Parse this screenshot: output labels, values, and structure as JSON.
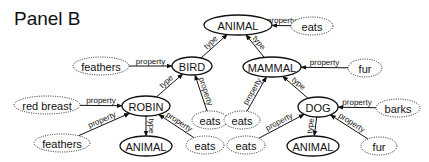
{
  "title": "Panel B",
  "colors": {
    "ink": "#111111",
    "background": "#ffffff"
  },
  "nodes": [
    {
      "id": "animal_top",
      "label": "ANIMAL",
      "kind": "concept",
      "x": 238,
      "y": 25,
      "rx": 34,
      "ry": 10
    },
    {
      "id": "eats_animal",
      "label": "eats",
      "kind": "property",
      "x": 312,
      "y": 26,
      "rx": 21,
      "ry": 9
    },
    {
      "id": "bird",
      "label": "BIRD",
      "kind": "concept",
      "x": 192,
      "y": 66,
      "rx": 20,
      "ry": 9
    },
    {
      "id": "feathers_bird",
      "label": "feathers",
      "kind": "property",
      "x": 101,
      "y": 66,
      "rx": 28,
      "ry": 9
    },
    {
      "id": "mammal",
      "label": "MAMMAL",
      "kind": "concept",
      "x": 272,
      "y": 67,
      "rx": 29,
      "ry": 10
    },
    {
      "id": "fur_mammal",
      "label": "fur",
      "kind": "property",
      "x": 365,
      "y": 68,
      "rx": 17,
      "ry": 9
    },
    {
      "id": "robin",
      "label": "ROBIN",
      "kind": "concept",
      "x": 146,
      "y": 106,
      "rx": 24,
      "ry": 10
    },
    {
      "id": "red_breast",
      "label": "red breast",
      "kind": "property",
      "x": 47,
      "y": 105,
      "rx": 33,
      "ry": 9
    },
    {
      "id": "eats_bird",
      "label": "eats",
      "kind": "property",
      "x": 210,
      "y": 120,
      "rx": 18,
      "ry": 9
    },
    {
      "id": "eats_mammal",
      "label": "eats",
      "kind": "property",
      "x": 242,
      "y": 120,
      "rx": 18,
      "ry": 9
    },
    {
      "id": "dog",
      "label": "DOG",
      "kind": "concept",
      "x": 318,
      "y": 107,
      "rx": 20,
      "ry": 10
    },
    {
      "id": "barks",
      "label": "barks",
      "kind": "property",
      "x": 398,
      "y": 108,
      "rx": 22,
      "ry": 9
    },
    {
      "id": "feathers_robin",
      "label": "feathers",
      "kind": "property",
      "x": 62,
      "y": 143,
      "rx": 28,
      "ry": 9
    },
    {
      "id": "animal_robin",
      "label": "ANIMAL",
      "kind": "concept",
      "x": 146,
      "y": 146,
      "rx": 26,
      "ry": 10
    },
    {
      "id": "eats_robin",
      "label": "eats",
      "kind": "property",
      "x": 205,
      "y": 145,
      "rx": 19,
      "ry": 9
    },
    {
      "id": "eats_dog",
      "label": "eats",
      "kind": "property",
      "x": 246,
      "y": 145,
      "rx": 19,
      "ry": 9
    },
    {
      "id": "animal_dog",
      "label": "ANIMAL",
      "kind": "concept",
      "x": 313,
      "y": 146,
      "rx": 26,
      "ry": 10
    },
    {
      "id": "fur_dog",
      "label": "fur",
      "kind": "property",
      "x": 379,
      "y": 146,
      "rx": 18,
      "ry": 9
    }
  ],
  "edges": [
    {
      "from": "eats_animal",
      "to": "animal_top",
      "label": "property"
    },
    {
      "from": "bird",
      "to": "animal_top",
      "label": "type"
    },
    {
      "from": "mammal",
      "to": "animal_top",
      "label": "type"
    },
    {
      "from": "feathers_bird",
      "to": "bird",
      "label": "property"
    },
    {
      "from": "eats_bird",
      "to": "bird",
      "label": "property"
    },
    {
      "from": "fur_mammal",
      "to": "mammal",
      "label": "property"
    },
    {
      "from": "eats_mammal",
      "to": "mammal",
      "label": "property"
    },
    {
      "from": "robin",
      "to": "bird",
      "label": "type"
    },
    {
      "from": "dog",
      "to": "mammal",
      "label": "type"
    },
    {
      "from": "red_breast",
      "to": "robin",
      "label": "property"
    },
    {
      "from": "feathers_robin",
      "to": "robin",
      "label": "property"
    },
    {
      "from": "eats_robin",
      "to": "robin",
      "label": "property"
    },
    {
      "from": "robin",
      "to": "animal_robin",
      "label": "type"
    },
    {
      "from": "barks",
      "to": "dog",
      "label": "property"
    },
    {
      "from": "eats_dog",
      "to": "dog",
      "label": "property"
    },
    {
      "from": "fur_dog",
      "to": "dog",
      "label": "property"
    },
    {
      "from": "dog",
      "to": "animal_dog",
      "label": "type"
    }
  ]
}
